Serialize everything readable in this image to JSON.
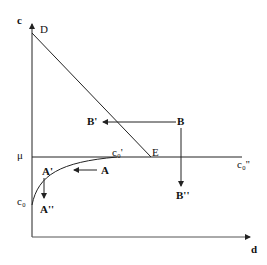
{
  "diagram": {
    "axes": {
      "y_label": "c",
      "x_label": "d"
    },
    "points": {
      "D": "D",
      "E": "E",
      "mu": "μ",
      "c0": "c₀",
      "c0_prime": "c₀'",
      "c0_dprime": "c₀''",
      "A": "A",
      "A_prime": "A'",
      "A_dprime": "A''",
      "B": "B",
      "B_prime": "B'",
      "B_dprime": "B''"
    },
    "colors": {
      "line": "#222222",
      "background": "#ffffff"
    }
  }
}
